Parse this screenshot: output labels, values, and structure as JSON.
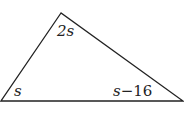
{
  "diagram": {
    "type": "triangle",
    "vertices": {
      "top": [
        61,
        13
      ],
      "left": [
        1,
        101
      ],
      "right": [
        183,
        101
      ]
    },
    "stroke_color": "#222222",
    "angle_labels": {
      "top": "2s",
      "left": "s",
      "right": "s−16"
    }
  }
}
